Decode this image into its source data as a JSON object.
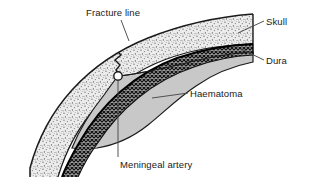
{
  "figure": {
    "background_color": "#ffffff",
    "width": 309,
    "height": 177
  },
  "labels": {
    "fracture_line": "Fracture line",
    "skull": "Skull",
    "dura": "Dura",
    "haematoma": "Haematoma",
    "meningeal_artery": "Meningeal artery"
  },
  "structures": {
    "skull": {
      "name": "Skull",
      "fill_style": "stipple",
      "fill_color": "#e6e6e6",
      "dot_color": "#555555",
      "outline_color": "#1a1a1a"
    },
    "dura": {
      "name": "Dura",
      "fill_style": "crosshatch",
      "fill_color": "#b0b0b0",
      "hatch_color": "#1a1a1a",
      "outline_color": "#000000"
    },
    "haematoma": {
      "name": "Haematoma",
      "fill_style": "solid",
      "fill_color": "#c8c8c8",
      "outline_color": "#1a1a1a"
    },
    "meningeal_artery": {
      "name": "Meningeal artery",
      "fill_style": "solid",
      "fill_color": "#ffffff",
      "outline_color": "#1a1a1a",
      "shape": "circle"
    },
    "fracture_line": {
      "name": "Fracture line",
      "stroke_color": "#1a1a1a",
      "shape": "zigzag"
    }
  },
  "leader_lines": {
    "color": "#4a4a4a",
    "width": 0.9
  }
}
